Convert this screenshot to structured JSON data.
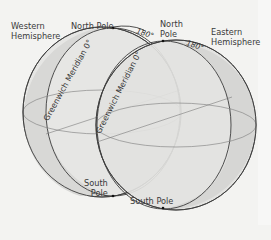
{
  "figure": {
    "labels": {
      "western_hemisphere": "Western\nHemisphere",
      "western_hemisphere_line1": "Western",
      "western_hemisphere_line2": "Hemisphere",
      "eastern_hemisphere_line1": "Eastern",
      "eastern_hemisphere_line2": "Hemisphere",
      "north_pole_left": "North Pole",
      "north_pole_right_line1": "North",
      "north_pole_right_line2": "Pole",
      "south_pole_left_line1": "South",
      "south_pole_left_line2": "Pole",
      "south_pole_right": "South Pole",
      "meridian_left": "Greenwich Meridian 0°",
      "meridian_right": "Greenwich Meridian 0°",
      "deg_180_left": "180°",
      "deg_180_right": "180°"
    },
    "colors": {
      "background": "#f3f3f1",
      "sphere_fill": "#e4e4e2",
      "hemisphere_band_fill": "#d6d6d4",
      "stroke": "#3c3c3c",
      "grid_line": "#7a7a7a"
    }
  }
}
